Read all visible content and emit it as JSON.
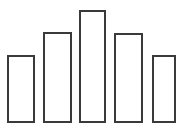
{
  "chart_data": {
    "type": "bar",
    "title": "",
    "subtitle": "",
    "xlabel": "",
    "ylabel": "",
    "categories": [
      "1",
      "2",
      "3",
      "4",
      "5"
    ],
    "values": [
      68,
      91,
      113,
      90,
      68
    ],
    "ylim": [
      0,
      123
    ],
    "grid": false,
    "legend": null,
    "annotations": [],
    "style": {
      "background": "#ffffff",
      "bar_fill": "#ffffff",
      "bar_stroke": "#3a3a3a",
      "bar_stroke_width": "2px"
    },
    "bars": [
      {
        "label": "1",
        "value": 68,
        "left": 7,
        "width": 28,
        "top": 55,
        "height": 68
      },
      {
        "label": "2",
        "value": 91,
        "left": 43,
        "width": 29,
        "top": 32,
        "height": 91
      },
      {
        "label": "3",
        "value": 113,
        "left": 79,
        "width": 27,
        "top": 10,
        "height": 113
      },
      {
        "label": "4",
        "value": 90,
        "left": 114,
        "width": 29,
        "top": 33,
        "height": 90
      },
      {
        "label": "5",
        "value": 68,
        "left": 152,
        "width": 24,
        "top": 55,
        "height": 68
      }
    ]
  }
}
